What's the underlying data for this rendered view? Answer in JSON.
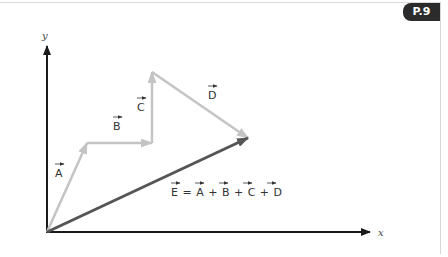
{
  "badge": {
    "label": "P.9",
    "color": "#2b2b2b"
  },
  "axes": {
    "x_label": "x",
    "y_label": "y",
    "color": "#1a1a1a"
  },
  "vectors": [
    {
      "name": "A",
      "label": "A",
      "from": [
        47,
        232
      ],
      "to": [
        87,
        143
      ],
      "color": "#c4c4c4"
    },
    {
      "name": "B",
      "label": "B",
      "from": [
        87,
        143
      ],
      "to": [
        152,
        143
      ],
      "color": "#c4c4c4"
    },
    {
      "name": "C",
      "label": "C",
      "from": [
        152,
        143
      ],
      "to": [
        152,
        72
      ],
      "color": "#c4c4c4"
    },
    {
      "name": "D",
      "label": "D",
      "from": [
        152,
        72
      ],
      "to": [
        248,
        138
      ],
      "color": "#c4c4c4"
    },
    {
      "name": "E",
      "label": "E",
      "from": [
        47,
        232
      ],
      "to": [
        248,
        138
      ],
      "color": "#555555"
    }
  ],
  "equation": {
    "text": "E = A + B + C + D"
  }
}
